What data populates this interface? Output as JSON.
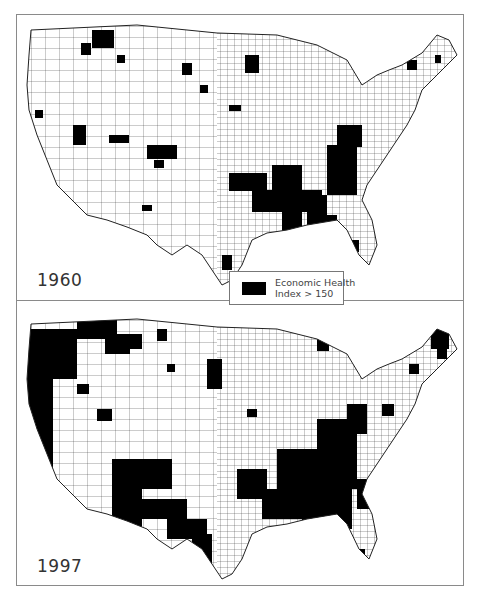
{
  "figure": {
    "panels": [
      {
        "id": "map-1960",
        "year_label": "1960"
      },
      {
        "id": "map-1997",
        "year_label": "1997"
      }
    ],
    "legend": {
      "swatch_color": "#000000",
      "line1": "Economic Health",
      "line2": "Index > 150"
    },
    "colors": {
      "highlight": "#000000",
      "background": "#ffffff",
      "county_lines": "#222222",
      "frame": "#8a8a8a"
    }
  }
}
